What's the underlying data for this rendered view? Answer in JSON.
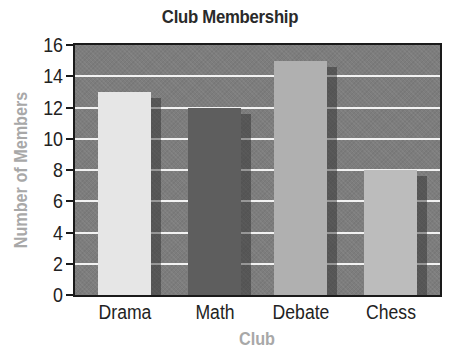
{
  "chart_data": {
    "type": "bar",
    "title": "Club Membership",
    "xlabel": "Club",
    "ylabel": "Number of Members",
    "categories": [
      "Drama",
      "Math",
      "Debate",
      "Chess"
    ],
    "values": [
      13,
      12,
      15,
      8
    ],
    "ylim": [
      0,
      16
    ],
    "yticks": [
      "0",
      "2",
      "4",
      "6",
      "8",
      "10",
      "12",
      "14",
      "16"
    ],
    "grid": true,
    "legend": null,
    "bar_colors": [
      "#e6e6e6",
      "#5e5e5e",
      "#b0b0b0",
      "#bcbcbc"
    ],
    "background_color": "#7d7d7d"
  }
}
